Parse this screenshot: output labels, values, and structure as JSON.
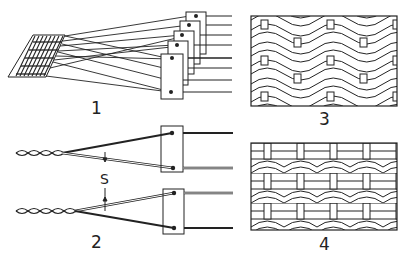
{
  "figure": {
    "panels": [
      {
        "id": "1",
        "label": "1",
        "description": "Multiple harness frames with heddles lifting warp threads from fabric"
      },
      {
        "id": "2",
        "label": "2",
        "description": "Two heddle frames forming shed with twisted warp threads",
        "shed_label": "S"
      },
      {
        "id": "3",
        "label": "3",
        "description": "Woven fabric structure pattern (variant A)"
      },
      {
        "id": "4",
        "label": "4",
        "description": "Woven fabric structure pattern (variant B)"
      }
    ],
    "colors": {
      "ink": "#222222",
      "background": "#ffffff"
    }
  }
}
